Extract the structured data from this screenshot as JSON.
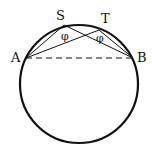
{
  "diagram": {
    "title": "",
    "circle": {
      "cx": 79,
      "cy": 84,
      "r": 59
    },
    "points": {
      "A": {
        "label": "A",
        "x": 26,
        "y": 58
      },
      "B": {
        "label": "B",
        "x": 133,
        "y": 58
      },
      "S": {
        "label": "S",
        "x": 64,
        "y": 25
      },
      "T": {
        "label": "T",
        "x": 99,
        "y": 30
      }
    },
    "angle_labels": {
      "at_S": "φ",
      "at_T": "φ"
    },
    "segments": [
      {
        "from": "A",
        "to": "S",
        "style": "solid"
      },
      {
        "from": "S",
        "to": "B",
        "style": "solid"
      },
      {
        "from": "A",
        "to": "T",
        "style": "solid"
      },
      {
        "from": "T",
        "to": "B",
        "style": "solid"
      },
      {
        "from": "A",
        "to": "B",
        "style": "dashed"
      }
    ]
  }
}
